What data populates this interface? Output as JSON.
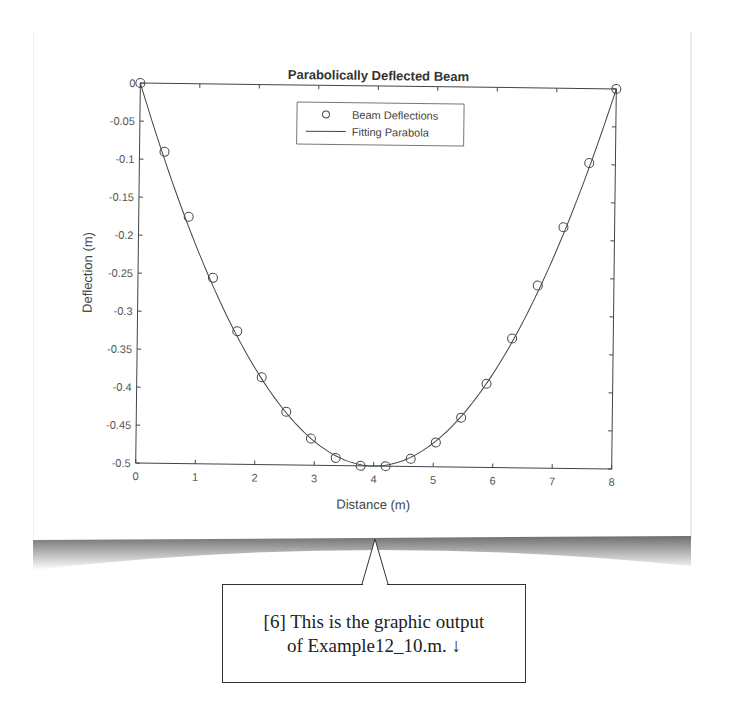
{
  "chart_data": {
    "type": "scatter+line",
    "title": "Parabolically Deflected Beam",
    "xlabel": "Distance (m)",
    "ylabel": "Deflection (m)",
    "xlim": [
      0,
      8
    ],
    "ylim": [
      -0.5,
      0
    ],
    "xticks": [
      "0",
      "1",
      "2",
      "3",
      "4",
      "5",
      "6",
      "7",
      "8"
    ],
    "yticks": [
      "0",
      "-0.05",
      "-0.1",
      "-0.15",
      "-0.2",
      "-0.25",
      "-0.3",
      "-0.35",
      "-0.4",
      "-0.45",
      "-0.5"
    ],
    "grid": false,
    "legend_position": "north (inside, top-center)",
    "series": [
      {
        "name": "Beam Deflections",
        "style": "open circle markers",
        "x": [
          0,
          0.42,
          0.84,
          1.26,
          1.68,
          2.1,
          2.52,
          2.94,
          3.36,
          3.78,
          4.2,
          4.62,
          5.04,
          5.46,
          5.88,
          6.3,
          6.72,
          7.14,
          7.56,
          8.0
        ],
        "y": [
          0,
          -0.09,
          -0.175,
          -0.255,
          -0.325,
          -0.385,
          -0.43,
          -0.465,
          -0.49,
          -0.5,
          -0.5,
          -0.49,
          -0.468,
          -0.435,
          -0.39,
          -0.33,
          -0.26,
          -0.183,
          -0.098,
          0
        ]
      },
      {
        "name": "Fitting Parabola",
        "style": "solid line",
        "equation": "y = 0.03125*x*(x-8)",
        "x": [
          0,
          0.5,
          1,
          1.5,
          2,
          2.5,
          3,
          3.5,
          4,
          4.5,
          5,
          5.5,
          6,
          6.5,
          7,
          7.5,
          8
        ],
        "y": [
          0,
          -0.1172,
          -0.2188,
          -0.3047,
          -0.375,
          -0.4297,
          -0.4688,
          -0.4922,
          -0.5,
          -0.4922,
          -0.4688,
          -0.4297,
          -0.375,
          -0.3047,
          -0.2188,
          -0.1172,
          0
        ]
      }
    ]
  },
  "legend": {
    "items": [
      {
        "label": "Beam Deflections",
        "symbol": "circle"
      },
      {
        "label": "Fitting Parabola",
        "symbol": "line"
      }
    ]
  },
  "callout": {
    "line1": "[6] This is the graphic output",
    "line2": "of Example12_10.m. ↓"
  },
  "colors": {
    "axis": "#333333",
    "text": "#444444",
    "shadow": "#7a7a7a"
  }
}
